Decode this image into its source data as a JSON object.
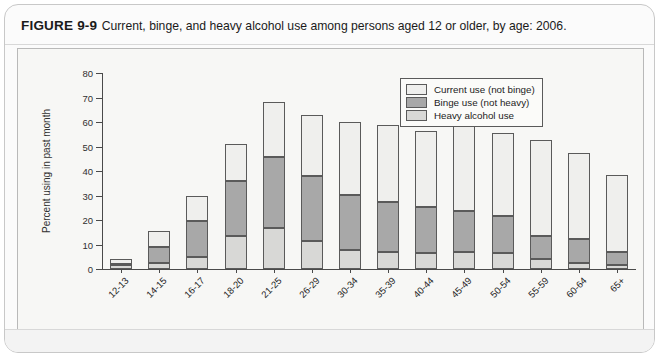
{
  "figure": {
    "label": "FIGURE 9-9",
    "caption": "Current, binge, and heavy alcohol use among persons aged 12 or older, by age: 2006."
  },
  "chart_data": {
    "type": "bar",
    "subtype": "stacked-bar",
    "title": "Current, binge, and heavy alcohol use among persons aged 12 or older, by age: 2006",
    "xlabel": "Age in years",
    "ylabel": "Percent using in past month",
    "ylim": [
      0,
      80
    ],
    "yticks": [
      0,
      10,
      20,
      30,
      40,
      50,
      60,
      70,
      80
    ],
    "grid": false,
    "legend_position": "top-right",
    "categories": [
      "12-13",
      "14-15",
      "16-17",
      "18-20",
      "21-25",
      "26-29",
      "30-34",
      "35-39",
      "40-44",
      "45-49",
      "50-54",
      "55-59",
      "60-64",
      "65+"
    ],
    "series": [
      {
        "name": "Heavy alcohol use",
        "color": "#d8d8d6",
        "values": [
          1.5,
          2.5,
          5.0,
          13.4,
          16.6,
          11.3,
          7.9,
          6.8,
          6.5,
          6.8,
          6.7,
          3.9,
          2.6,
          1.5
        ]
      },
      {
        "name": "Binge use (not heavy)",
        "color": "#a8a8a8",
        "values": [
          0.5,
          6.4,
          14.8,
          22.6,
          29.0,
          26.7,
          22.4,
          20.6,
          18.8,
          16.7,
          15.1,
          9.5,
          9.8,
          5.5
        ]
      },
      {
        "name": "Current use (not binge)",
        "color": "#efefed",
        "values": [
          1.9,
          6.7,
          9.9,
          15.1,
          22.7,
          25.0,
          29.8,
          31.4,
          31.0,
          35.1,
          33.8,
          39.3,
          35.0,
          31.2
        ]
      }
    ],
    "cumulative_tops": {
      "heavy": [
        1.5,
        2.5,
        5.0,
        13.4,
        16.6,
        11.3,
        7.9,
        6.8,
        6.5,
        6.8,
        6.7,
        3.9,
        2.6,
        1.5
      ],
      "binge": [
        2.0,
        8.9,
        19.8,
        36.0,
        45.6,
        38.0,
        30.3,
        27.4,
        25.3,
        23.5,
        21.8,
        13.4,
        12.4,
        7.0
      ],
      "total": [
        3.9,
        15.6,
        29.7,
        51.1,
        68.3,
        63.0,
        60.1,
        58.8,
        56.3,
        58.6,
        55.6,
        52.7,
        47.4,
        38.2
      ]
    }
  }
}
